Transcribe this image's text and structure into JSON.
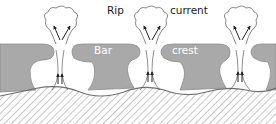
{
  "labels": {
    "rip": "Rip",
    "current": "current",
    "bar": "Bar",
    "crest": "crest"
  },
  "colors": {
    "bar_fill": "#a9a9a9",
    "bar_stroke": "#8a8a8a",
    "shore_hatch": "#8f8f8f",
    "shore_line": "#6f6f6f",
    "line": "#333333",
    "plume_stroke": "#555555",
    "background": "#ffffff"
  },
  "features": {
    "rip_channels": 3,
    "sandbars": 4,
    "arrows_per_channel": 4
  }
}
